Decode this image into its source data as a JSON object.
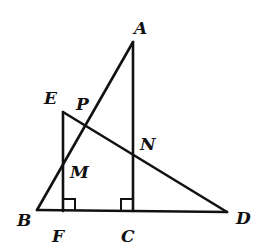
{
  "diagram": {
    "type": "geometry",
    "points": {
      "A": {
        "label": "A",
        "x": 133,
        "y": 42,
        "lx": 134,
        "ly": 34
      },
      "B": {
        "label": "B",
        "x": 37,
        "y": 210,
        "lx": 17,
        "ly": 226
      },
      "C": {
        "label": "C",
        "x": 133,
        "y": 211,
        "lx": 121,
        "ly": 242
      },
      "D": {
        "label": "D",
        "x": 227,
        "y": 212,
        "lx": 236,
        "ly": 224
      },
      "E": {
        "label": "E",
        "x": 63,
        "y": 112,
        "lx": 44,
        "ly": 104
      },
      "F": {
        "label": "F",
        "x": 63,
        "y": 211,
        "lx": 52,
        "ly": 242
      },
      "M": {
        "label": "M",
        "x": 63,
        "y": 165,
        "lx": 70,
        "ly": 178
      },
      "N": {
        "label": "N",
        "x": 133,
        "y": 155,
        "lx": 140,
        "ly": 150
      },
      "P": {
        "label": "P",
        "x": 85,
        "y": 124,
        "lx": 76,
        "ly": 110
      }
    },
    "segments": [
      [
        "A",
        "B"
      ],
      [
        "A",
        "C"
      ],
      [
        "B",
        "D"
      ],
      [
        "E",
        "F"
      ],
      [
        "E",
        "D"
      ]
    ],
    "right_angles": [
      {
        "at": "F",
        "note": "EF ⊥ BD"
      },
      {
        "at": "C",
        "note": "AC ⊥ BD"
      }
    ],
    "intersections": {
      "P": "AB ∩ ED",
      "M": "AB ∩ EF",
      "N": "AC ∩ ED"
    }
  }
}
